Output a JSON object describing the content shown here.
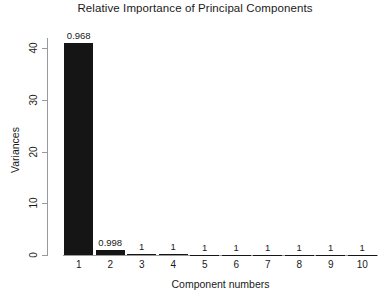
{
  "chart_data": {
    "type": "bar",
    "title": "Relative Importance of Principal Components",
    "xlabel": "Component numbers",
    "ylabel": "Variances",
    "categories": [
      "1",
      "2",
      "3",
      "4",
      "5",
      "6",
      "7",
      "8",
      "9",
      "10"
    ],
    "values": [
      41.0,
      1.0,
      0.15,
      0.1,
      0.08,
      0.06,
      0.05,
      0.04,
      0.03,
      0.02
    ],
    "bar_labels": [
      "0.968",
      "0.998",
      "1",
      "1",
      "1",
      "1",
      "1",
      "1",
      "1",
      "1"
    ],
    "ylim": [
      0,
      43
    ],
    "yticks": [
      0,
      10,
      20,
      30,
      40
    ],
    "ytick_labels": [
      "0",
      "10",
      "20",
      "30",
      "40"
    ],
    "grid": false,
    "legend": false,
    "bar_color": "#151515",
    "axis_color": "#9a9a9a",
    "text_color": "#1a1a1a",
    "background": "#ffffff",
    "annotation_note": "Labels above bars show cumulative proportion of variance explained"
  }
}
